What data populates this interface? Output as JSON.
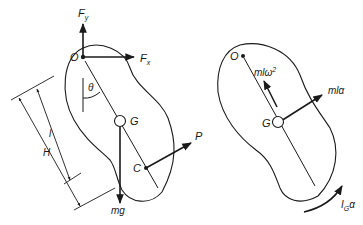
{
  "figure": {
    "left_panel": {
      "labels": {
        "pivot": "O",
        "force_y": "F",
        "force_y_sub": "y",
        "force_x": "F",
        "force_x_sub": "x",
        "angle": "θ",
        "center_of_mass": "G",
        "point_c": "C",
        "applied_force": "P",
        "weight": "mg",
        "dim_short": "l",
        "dim_long": "H"
      }
    },
    "right_panel": {
      "labels": {
        "pivot": "O",
        "center_of_mass": "G",
        "centripetal": "mlω",
        "centripetal_sup": "2",
        "tangential": "mlα",
        "moment": "I",
        "moment_sub": "G",
        "moment_alpha": "α"
      }
    },
    "colors": {
      "ink": "#1a1a1a",
      "background": "#ffffff"
    }
  }
}
